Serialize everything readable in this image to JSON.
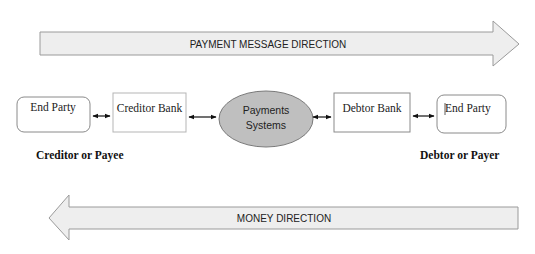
{
  "diagram": {
    "top_arrow": {
      "label": "PAYMENT MESSAGE DIRECTION",
      "direction": "right"
    },
    "bottom_arrow": {
      "label": "MONEY DIRECTION",
      "direction": "left"
    },
    "nodes": [
      {
        "id": "end-party-left",
        "label": "End Party",
        "shape": "rounded-rect"
      },
      {
        "id": "creditor-bank",
        "label": "Creditor Bank",
        "shape": "rect"
      },
      {
        "id": "payments-systems",
        "label_line1": "Payments",
        "label_line2": "Systems",
        "shape": "ellipse"
      },
      {
        "id": "debtor-bank",
        "label": "Debtor Bank",
        "shape": "rect"
      },
      {
        "id": "end-party-right",
        "label": "End Party",
        "shape": "rounded-rect"
      }
    ],
    "connectors": [
      {
        "from": "end-party-left",
        "to": "creditor-bank",
        "type": "bidirectional"
      },
      {
        "from": "creditor-bank",
        "to": "payments-systems",
        "type": "bidirectional"
      },
      {
        "from": "payments-systems",
        "to": "debtor-bank",
        "type": "bidirectional"
      },
      {
        "from": "debtor-bank",
        "to": "end-party-right",
        "type": "bidirectional"
      }
    ],
    "roles": {
      "left": "Creditor or Payee",
      "right": "Debtor or Payer"
    },
    "colors": {
      "arrow_fill": "#eeeeee",
      "arrow_stroke": "#9a9a9a",
      "ellipse_fill": "#bfbfbf",
      "box_stroke": "#8a8a8a"
    }
  }
}
